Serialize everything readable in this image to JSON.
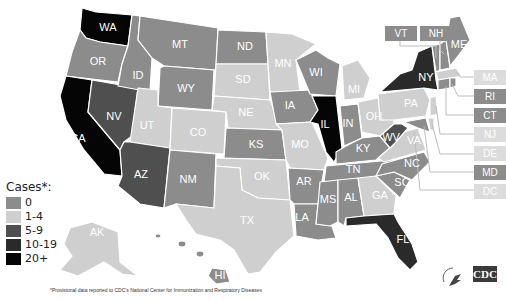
{
  "legend": {
    "title": "Cases*:",
    "items": [
      {
        "label": "0",
        "color": "#8c8c8c"
      },
      {
        "label": "1-4",
        "color": "#cfcfcf"
      },
      {
        "label": "5-9",
        "color": "#4f4f4f"
      },
      {
        "label": "10-19",
        "color": "#2a2a2a"
      },
      {
        "label": "20+",
        "color": "#050505"
      }
    ]
  },
  "footnote": "*Provisional data reported to CDC's National Center for Immunization and Respiratory Diseases",
  "logos": {
    "cdc": "CDC",
    "hhs": "hhs-eagle"
  },
  "states": {
    "WA": {
      "label": "WA",
      "category": "20+"
    },
    "OR": {
      "label": "OR",
      "category": "0"
    },
    "CA": {
      "label": "CA",
      "category": "20+"
    },
    "ID": {
      "label": "ID",
      "category": "0"
    },
    "NV": {
      "label": "NV",
      "category": "5-9"
    },
    "MT": {
      "label": "MT",
      "category": "0"
    },
    "WY": {
      "label": "WY",
      "category": "0"
    },
    "UT": {
      "label": "UT",
      "category": "1-4"
    },
    "AZ": {
      "label": "AZ",
      "category": "5-9"
    },
    "CO": {
      "label": "CO",
      "category": "1-4"
    },
    "NM": {
      "label": "NM",
      "category": "0"
    },
    "ND": {
      "label": "ND",
      "category": "0"
    },
    "SD": {
      "label": "SD",
      "category": "1-4"
    },
    "NE": {
      "label": "NE",
      "category": "1-4"
    },
    "KS": {
      "label": "KS",
      "category": "0"
    },
    "OK": {
      "label": "OK",
      "category": "1-4"
    },
    "TX": {
      "label": "TX",
      "category": "1-4"
    },
    "MN": {
      "label": "MN",
      "category": "1-4"
    },
    "IA": {
      "label": "IA",
      "category": "0"
    },
    "MO": {
      "label": "MO",
      "category": "1-4"
    },
    "AR": {
      "label": "AR",
      "category": "0"
    },
    "LA": {
      "label": "LA",
      "category": "0"
    },
    "WI": {
      "label": "WI",
      "category": "0"
    },
    "IL": {
      "label": "IL",
      "category": "20+"
    },
    "MI": {
      "label": "MI",
      "category": "1-4"
    },
    "IN": {
      "label": "IN",
      "category": "0"
    },
    "OH": {
      "label": "OH",
      "category": "1-4"
    },
    "KY": {
      "label": "KY",
      "category": "0"
    },
    "TN": {
      "label": "TN",
      "category": "0"
    },
    "MS": {
      "label": "MS",
      "category": "0"
    },
    "AL": {
      "label": "AL",
      "category": "0"
    },
    "GA": {
      "label": "GA",
      "category": "1-4"
    },
    "FL": {
      "label": "FL",
      "category": "5-9"
    },
    "SC": {
      "label": "SC",
      "category": "0"
    },
    "NC": {
      "label": "NC",
      "category": "0"
    },
    "VA": {
      "label": "VA",
      "category": "1-4"
    },
    "WV": {
      "label": "WV",
      "category": "5-9"
    },
    "PA": {
      "label": "PA",
      "category": "1-4"
    },
    "NY": {
      "label": "NY",
      "category": "10-19"
    },
    "ME": {
      "label": "ME",
      "category": "0"
    },
    "AK": {
      "label": "AK",
      "category": "1-4"
    },
    "HI": {
      "label": "HI",
      "category": "0"
    }
  },
  "callouts": [
    {
      "label": "VT",
      "category": "0"
    },
    {
      "label": "NH",
      "category": "0"
    },
    {
      "label": "MA",
      "category": "1-4"
    },
    {
      "label": "RI",
      "category": "0"
    },
    {
      "label": "CT",
      "category": "0"
    },
    {
      "label": "NJ",
      "category": "1-4"
    },
    {
      "label": "DE",
      "category": "1-4"
    },
    {
      "label": "MD",
      "category": "0"
    },
    {
      "label": "DC",
      "category": "1-4"
    }
  ]
}
